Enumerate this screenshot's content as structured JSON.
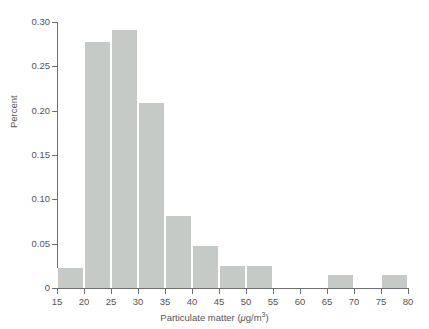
{
  "chart_data": {
    "type": "bar",
    "title": "",
    "subtitle": "",
    "xlabel": "Particulate matter (μg/m³)",
    "ylabel": "Percent",
    "xlabel_parts": {
      "text_before": "Particulate matter (",
      "mu": "μ",
      "unit": "g/m",
      "exponent": "3",
      "text_after": ")"
    },
    "xlim": [
      15,
      80
    ],
    "ylim": [
      0,
      0.3
    ],
    "bin_width": 5,
    "grid": false,
    "legend": null,
    "bar_color": "#c6cac7",
    "axis_color": "#6f6f6f",
    "text_color": "#555555",
    "background_color": "#ffffff",
    "xticks": [
      15,
      20,
      25,
      30,
      35,
      40,
      45,
      50,
      55,
      60,
      65,
      70,
      75,
      80
    ],
    "xtick_labels": [
      "15",
      "20",
      "25",
      "30",
      "35",
      "40",
      "45",
      "50",
      "55",
      "60",
      "65",
      "70",
      "75",
      "80"
    ],
    "yticks": [
      0,
      0.05,
      0.1,
      0.15,
      0.2,
      0.25,
      0.3
    ],
    "ytick_labels": [
      "0",
      "0.05",
      "0.10",
      "0.15",
      "0.20",
      "0.25",
      "0.30"
    ],
    "categories": [
      "15-20",
      "20-25",
      "25-30",
      "30-35",
      "35-40",
      "40-45",
      "45-50",
      "50-55",
      "55-60",
      "60-65",
      "65-70",
      "70-75",
      "75-80"
    ],
    "bin_edges": [
      15,
      20,
      25,
      30,
      35,
      40,
      45,
      50,
      55,
      60,
      65,
      70,
      75,
      80
    ],
    "values": [
      0.023,
      0.278,
      0.291,
      0.209,
      0.081,
      0.047,
      0.025,
      0.025,
      0.0,
      0.0,
      0.015,
      0.0,
      0.015
    ],
    "bars": [
      {
        "x0": 15,
        "x1": 20,
        "value": 0.023
      },
      {
        "x0": 20,
        "x1": 25,
        "value": 0.278
      },
      {
        "x0": 25,
        "x1": 30,
        "value": 0.291
      },
      {
        "x0": 30,
        "x1": 35,
        "value": 0.209
      },
      {
        "x0": 35,
        "x1": 40,
        "value": 0.081
      },
      {
        "x0": 40,
        "x1": 45,
        "value": 0.047
      },
      {
        "x0": 45,
        "x1": 50,
        "value": 0.025
      },
      {
        "x0": 50,
        "x1": 55,
        "value": 0.025
      },
      {
        "x0": 55,
        "x1": 60,
        "value": 0.0
      },
      {
        "x0": 60,
        "x1": 65,
        "value": 0.0
      },
      {
        "x0": 65,
        "x1": 70,
        "value": 0.015
      },
      {
        "x0": 70,
        "x1": 75,
        "value": 0.0
      },
      {
        "x0": 75,
        "x1": 80,
        "value": 0.015
      }
    ]
  }
}
